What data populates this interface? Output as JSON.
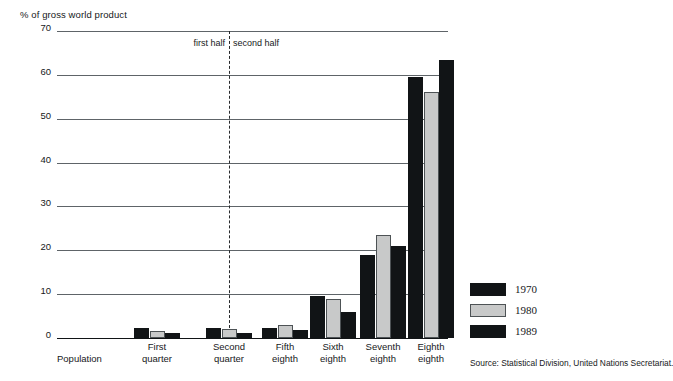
{
  "chart_data": {
    "type": "bar",
    "title": "% of gross world product",
    "ylabel": "% of gross world product",
    "xlabel": "",
    "ylim": [
      0,
      70
    ],
    "yticks": [
      70,
      60,
      50,
      40,
      30,
      20,
      10,
      0
    ],
    "grid": true,
    "legend_position": "right",
    "categories": [
      "Population",
      "First quarter",
      "Second quarter",
      "Fifth eighth",
      "Sixth eighth",
      "Seventh eighth",
      "Eighth eighth"
    ],
    "series": [
      {
        "name": "1970",
        "color": "#111416",
        "values": [
          null,
          2.2,
          2.2,
          2.2,
          9.5,
          19.0,
          59.5
        ]
      },
      {
        "name": "1980",
        "color": "#c8c9c9",
        "values": [
          null,
          1.7,
          2.0,
          3.0,
          9.0,
          23.5,
          56.0
        ]
      },
      {
        "name": "1989",
        "color": "#111416",
        "values": [
          null,
          1.1,
          1.2,
          1.8,
          6.0,
          21.0,
          63.5
        ]
      }
    ],
    "annotations": [
      {
        "id": "first-half",
        "text": "first half"
      },
      {
        "id": "second-half",
        "text": "second half"
      }
    ],
    "source": "Source: Statistical Division, United Nations Secretariat."
  },
  "axis": {
    "title": "% of gross world product",
    "ticks": [
      "70",
      "60",
      "50",
      "40",
      "30",
      "20",
      "10",
      "0"
    ]
  },
  "dividers": {
    "first_half": "first half",
    "second_half": "second half"
  },
  "x_labels": [
    {
      "line1": "Population",
      "line2": ""
    },
    {
      "line1": "First",
      "line2": "quarter"
    },
    {
      "line1": "Second",
      "line2": "quarter"
    },
    {
      "line1": "Fifth",
      "line2": "eighth"
    },
    {
      "line1": "Sixth",
      "line2": "eighth"
    },
    {
      "line1": "Seventh",
      "line2": "eighth"
    },
    {
      "line1": "Eighth",
      "line2": "eighth"
    }
  ],
  "legend": {
    "items": [
      {
        "label": "1970",
        "style": "dark"
      },
      {
        "label": "1980",
        "style": "light"
      },
      {
        "label": "1989",
        "style": "dark"
      }
    ]
  },
  "footer": {
    "source": "Source: Statistical Division, United Nations Secretariat."
  }
}
